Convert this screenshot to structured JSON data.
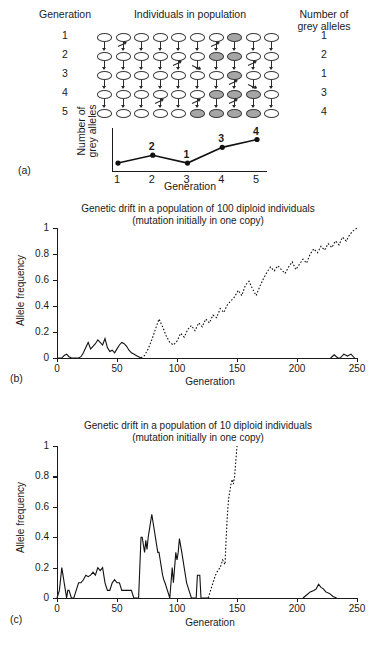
{
  "panel_a": {
    "label": "(a)",
    "headers": {
      "generation": "Generation",
      "individuals": "Individuals in population",
      "alleles": "Number of\ngrey alleles"
    },
    "generations": [
      "1",
      "2",
      "3",
      "4",
      "5"
    ],
    "allele_counts": [
      "1",
      "2",
      "1",
      "3",
      "4"
    ],
    "population_size": 10,
    "grey_positions": [
      [
        7
      ],
      [
        6,
        7
      ],
      [
        7
      ],
      [
        6,
        7,
        8
      ],
      [
        5,
        6,
        7,
        8
      ]
    ],
    "mini_chart": {
      "xlabel": "Generation",
      "ylabel": "Number of\ngrey alleles",
      "xticks": [
        "1",
        "2",
        "3",
        "4",
        "5"
      ],
      "point_labels": [
        "",
        "2",
        "1",
        "3",
        "4"
      ],
      "values": [
        1,
        2,
        1,
        3,
        4
      ]
    }
  },
  "panel_b": {
    "label": "(b)"
  },
  "panel_c": {
    "label": "(c)"
  },
  "chart_data": [
    {
      "type": "line",
      "panel": "b",
      "title": "Genetic drift in a population of 100 diploid individuals\n(mutation initially in one copy)",
      "title_line1": "Genetic drift in a population of 100 diploid individuals",
      "title_line2": "(mutation initially in one copy)",
      "xlabel": "Generation",
      "ylabel": "Allele frequency",
      "xlim": [
        0,
        250
      ],
      "ylim": [
        0,
        1
      ],
      "xticks": [
        0,
        50,
        100,
        150,
        200,
        250
      ],
      "yticks": [
        0,
        0.2,
        0.4,
        0.6,
        0.8,
        1
      ],
      "grid": false,
      "legend": "none",
      "series": [
        {
          "name": "lost-lineage-solid",
          "style": "solid",
          "x": [
            0,
            4,
            6,
            8,
            10,
            12,
            14,
            16,
            18,
            20,
            22,
            24,
            26,
            28,
            30,
            32,
            34,
            36,
            38,
            40,
            42,
            44,
            46,
            48,
            50,
            52,
            54,
            56,
            58,
            60,
            62,
            64,
            66,
            68,
            70
          ],
          "values": [
            0,
            0,
            0.02,
            0.03,
            0.01,
            0,
            0,
            0,
            0,
            0.01,
            0.04,
            0.08,
            0.12,
            0.07,
            0.09,
            0.11,
            0.14,
            0.12,
            0.1,
            0.15,
            0.08,
            0.05,
            0.06,
            0.04,
            0.07,
            0.1,
            0.12,
            0.11,
            0.09,
            0.06,
            0.04,
            0.03,
            0.02,
            0.01,
            0
          ]
        },
        {
          "name": "fixed-lineage-dotted",
          "style": "dotted",
          "x": [
            70,
            73,
            76,
            79,
            82,
            85,
            88,
            91,
            94,
            97,
            100,
            103,
            106,
            109,
            112,
            115,
            118,
            121,
            124,
            127,
            130,
            133,
            136,
            139,
            142,
            145,
            148,
            151,
            154,
            157,
            160,
            163,
            166,
            169,
            172,
            175,
            178,
            181,
            184,
            187,
            190,
            193,
            196,
            199,
            202,
            205,
            208,
            211,
            214,
            217,
            220,
            223,
            226,
            229,
            232,
            235,
            238,
            241,
            244,
            247,
            250
          ],
          "values": [
            0,
            0.02,
            0.07,
            0.14,
            0.22,
            0.3,
            0.24,
            0.17,
            0.12,
            0.1,
            0.13,
            0.19,
            0.16,
            0.22,
            0.25,
            0.21,
            0.27,
            0.24,
            0.3,
            0.27,
            0.33,
            0.31,
            0.38,
            0.35,
            0.41,
            0.44,
            0.47,
            0.52,
            0.48,
            0.56,
            0.59,
            0.53,
            0.48,
            0.55,
            0.61,
            0.66,
            0.7,
            0.67,
            0.71,
            0.68,
            0.65,
            0.7,
            0.74,
            0.68,
            0.72,
            0.76,
            0.73,
            0.8,
            0.84,
            0.81,
            0.86,
            0.83,
            0.88,
            0.85,
            0.9,
            0.87,
            0.93,
            0.9,
            0.95,
            0.98,
            1.0
          ]
        },
        {
          "name": "late-blips-solid",
          "style": "solid",
          "x": [
            228,
            231,
            234,
            236,
            239,
            242,
            245,
            248
          ],
          "values": [
            0,
            0.025,
            0,
            0,
            0.03,
            0.015,
            0.03,
            0
          ]
        }
      ]
    },
    {
      "type": "line",
      "panel": "c",
      "title": "Genetic drift in a population of 10 diploid individuals\n(mutation initially in one copy)",
      "title_line1": "Genetic drift in a population of 10 diploid individuals",
      "title_line2": "(mutation initially in one copy)",
      "xlabel": "Generation",
      "ylabel": "Allele frequency",
      "xlim": [
        0,
        250
      ],
      "ylim": [
        0,
        1
      ],
      "xticks": [
        0,
        50,
        100,
        150,
        200,
        250
      ],
      "yticks": [
        0,
        0.2,
        0.4,
        0.6,
        0.8,
        1
      ],
      "grid": false,
      "legend": "none",
      "series": [
        {
          "name": "drifting-lineage-solid",
          "style": "solid",
          "x": [
            0,
            2,
            4,
            5,
            6,
            7,
            8,
            9,
            10,
            12,
            14,
            16,
            18,
            20,
            22,
            24,
            26,
            28,
            30,
            32,
            34,
            36,
            38,
            40,
            42,
            44,
            46,
            48,
            50,
            52,
            54,
            56,
            58,
            60,
            62,
            64,
            66,
            68,
            70,
            71,
            72,
            73,
            74,
            75,
            76,
            77,
            78,
            79,
            80,
            81,
            82,
            83,
            84,
            85,
            86,
            87,
            88,
            89,
            90,
            92,
            94,
            95,
            96,
            97,
            98,
            99,
            100,
            101,
            102,
            104,
            106,
            108,
            110,
            112,
            114,
            116,
            117,
            118,
            119,
            120,
            121,
            122,
            123,
            124,
            125,
            126,
            127,
            128
          ],
          "values": [
            0,
            0.05,
            0.2,
            0.15,
            0.1,
            0.05,
            0,
            0.05,
            0.05,
            0,
            0,
            0.05,
            0.1,
            0.1,
            0.12,
            0.15,
            0.14,
            0.15,
            0.17,
            0.15,
            0.2,
            0.18,
            0.2,
            0.1,
            0.05,
            0.05,
            0.1,
            0.12,
            0.1,
            0.1,
            0.05,
            0.05,
            0.05,
            0.05,
            0.05,
            0,
            0,
            0,
            0.4,
            0.4,
            0.35,
            0.3,
            0.38,
            0.32,
            0.4,
            0.45,
            0.5,
            0.55,
            0.5,
            0.45,
            0.4,
            0.35,
            0.3,
            0.3,
            0.25,
            0.2,
            0.15,
            0.12,
            0.1,
            0.05,
            0,
            0.1,
            0.2,
            0.1,
            0.2,
            0.3,
            0.25,
            0.3,
            0.39,
            0.3,
            0.2,
            0.1,
            0.05,
            0,
            0,
            0,
            0.15,
            0.15,
            0.15,
            0,
            0,
            0,
            0,
            0,
            0,
            0,
            0
          ]
        },
        {
          "name": "fixed-lineage-dotted",
          "style": "dotted",
          "x": [
            126,
            128,
            130,
            132,
            134,
            136,
            138,
            140,
            141,
            142,
            143,
            144,
            145,
            146,
            147,
            148,
            149,
            150
          ],
          "values": [
            0,
            0.05,
            0.1,
            0.15,
            0.18,
            0.2,
            0.25,
            0.22,
            0.4,
            0.55,
            0.65,
            0.7,
            0.75,
            0.78,
            0.75,
            0.8,
            0.9,
            1.0
          ]
        },
        {
          "name": "late-lineage-solid",
          "style": "solid",
          "x": [
            205,
            208,
            211,
            214,
            216,
            218,
            220,
            222,
            224,
            227,
            230,
            233
          ],
          "values": [
            0,
            0.02,
            0.04,
            0.05,
            0.06,
            0.09,
            0.07,
            0.06,
            0.04,
            0.03,
            0.01,
            0
          ]
        }
      ]
    }
  ]
}
